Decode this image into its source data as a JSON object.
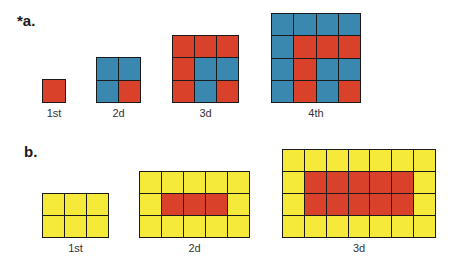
{
  "colors": {
    "red": "#d9412b",
    "blue": "#3a88b0",
    "yellow": "#f5e93a",
    "border": "#1a1a1a"
  },
  "part_a": {
    "label": "*a.",
    "figures": [
      {
        "caption": "1st",
        "rows": 1,
        "cols": 1,
        "x": 42,
        "y": 79,
        "w": 24,
        "h": 24,
        "cells": [
          "R"
        ]
      },
      {
        "caption": "2d",
        "rows": 2,
        "cols": 2,
        "x": 96,
        "y": 57,
        "w": 45,
        "h": 46,
        "cells": [
          "B",
          "B",
          "B",
          "R"
        ]
      },
      {
        "caption": "3d",
        "rows": 3,
        "cols": 3,
        "x": 172,
        "y": 35,
        "w": 67,
        "h": 68,
        "cells": [
          "R",
          "R",
          "R",
          "R",
          "B",
          "B",
          "R",
          "B",
          "R"
        ]
      },
      {
        "caption": "4th",
        "rows": 4,
        "cols": 4,
        "x": 271,
        "y": 13,
        "w": 90,
        "h": 90,
        "cells": [
          "B",
          "B",
          "B",
          "B",
          "B",
          "R",
          "R",
          "R",
          "B",
          "R",
          "B",
          "B",
          "B",
          "R",
          "B",
          "R"
        ]
      }
    ]
  },
  "part_b": {
    "label": "b.",
    "figures": [
      {
        "caption": "1st",
        "rows": 2,
        "cols": 3,
        "x": 42,
        "y": 193,
        "w": 67,
        "h": 45,
        "cells": [
          "Y",
          "Y",
          "Y",
          "Y",
          "Y",
          "Y"
        ]
      },
      {
        "caption": "2d",
        "rows": 3,
        "cols": 5,
        "x": 139,
        "y": 171,
        "w": 111,
        "h": 67,
        "cells": [
          "Y",
          "Y",
          "Y",
          "Y",
          "Y",
          "Y",
          "R",
          "R",
          "R",
          "Y",
          "Y",
          "Y",
          "Y",
          "Y",
          "Y"
        ]
      },
      {
        "caption": "3d",
        "rows": 4,
        "cols": 7,
        "x": 282,
        "y": 149,
        "w": 154,
        "h": 89,
        "cells": [
          "Y",
          "Y",
          "Y",
          "Y",
          "Y",
          "Y",
          "Y",
          "Y",
          "R",
          "R",
          "R",
          "R",
          "R",
          "Y",
          "Y",
          "R",
          "R",
          "R",
          "R",
          "R",
          "Y",
          "Y",
          "Y",
          "Y",
          "Y",
          "Y",
          "Y",
          "Y"
        ]
      }
    ]
  }
}
